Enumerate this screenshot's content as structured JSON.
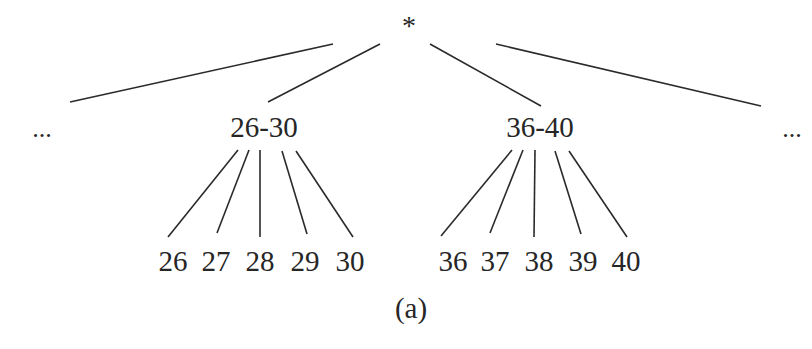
{
  "diagram": {
    "type": "tree",
    "caption": "(a)",
    "root": {
      "label": "*"
    },
    "level1": [
      {
        "label": "...",
        "kind": "ellipsis"
      },
      {
        "label": "26-30",
        "children": [
          "26",
          "27",
          "28",
          "29",
          "30"
        ]
      },
      {
        "label": "36-40",
        "children": [
          "36",
          "37",
          "38",
          "39",
          "40"
        ]
      },
      {
        "label": "...",
        "kind": "ellipsis"
      }
    ]
  },
  "colors": {
    "line": "#2a2a2a",
    "text": "#262626",
    "background": "#ffffff"
  }
}
